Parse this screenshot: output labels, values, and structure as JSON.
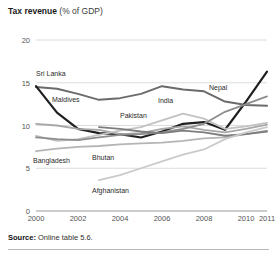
{
  "title": {
    "bold": "Tax revenue",
    "rest": " (% of GDP)"
  },
  "source": {
    "bold": "Source:",
    "rest": " Online table 5.6."
  },
  "chart_data": {
    "type": "line",
    "title": "Tax revenue (% of GDP)",
    "xlabel": "",
    "ylabel": "",
    "xlim": [
      2000,
      2011
    ],
    "ylim": [
      0,
      20
    ],
    "yticks": [
      0,
      5,
      10,
      15,
      20
    ],
    "xticks": [
      2000,
      2002,
      2004,
      2006,
      2008,
      2010,
      2011
    ],
    "grid": true,
    "legend": "inline-labels",
    "x": [
      2000,
      2001,
      2002,
      2003,
      2004,
      2005,
      2006,
      2007,
      2008,
      2009,
      2010,
      2011
    ],
    "series": [
      {
        "name": "Sri Lanka",
        "color": "#6b6b6b",
        "width": 2.0,
        "label_x": 36,
        "label_y": 70,
        "values": [
          14.5,
          14.3,
          13.7,
          13.0,
          13.2,
          13.7,
          14.6,
          14.2,
          14.0,
          12.8,
          12.4,
          12.3
        ]
      },
      {
        "name": "Maldives",
        "color": "#1f1f1f",
        "width": 2.2,
        "label_x": 52,
        "label_y": 96,
        "values": [
          14.6,
          11.5,
          9.6,
          9.1,
          9.0,
          8.6,
          9.3,
          10.2,
          10.4,
          9.5,
          12.8,
          16.3
        ]
      },
      {
        "name": "Pakistan",
        "color": "#a8a8a8",
        "width": 1.8,
        "label_x": 120,
        "label_y": 112,
        "values": [
          10.2,
          10.0,
          9.6,
          9.5,
          9.0,
          9.1,
          9.6,
          9.9,
          9.5,
          9.2,
          9.6,
          10.1
        ]
      },
      {
        "name": "India",
        "color": "#c2c2c2",
        "width": 1.8,
        "label_x": 158,
        "label_y": 97,
        "values": [
          8.8,
          8.2,
          8.4,
          8.9,
          9.4,
          9.8,
          10.6,
          11.4,
          10.8,
          9.6,
          9.9,
          10.3
        ]
      },
      {
        "name": "Nepal",
        "color": "#8d8d8d",
        "width": 1.8,
        "label_x": 209,
        "label_y": 84,
        "values": [
          8.6,
          8.4,
          8.3,
          8.6,
          8.9,
          9.0,
          9.2,
          9.6,
          10.2,
          11.6,
          12.5,
          13.4
        ]
      },
      {
        "name": "Bangladesh",
        "color": "#b5b5b5",
        "width": 1.8,
        "label_x": 33,
        "label_y": 157,
        "values": [
          7.0,
          7.3,
          7.5,
          7.6,
          7.8,
          7.9,
          8.0,
          8.2,
          8.5,
          8.6,
          9.0,
          9.4
        ]
      },
      {
        "name": "Bhutan",
        "color": "#7d7d7d",
        "width": 1.8,
        "label_x": 92,
        "label_y": 154,
        "values": [
          null,
          null,
          null,
          9.8,
          9.6,
          9.3,
          9.1,
          9.4,
          9.2,
          8.8,
          9.0,
          9.3
        ]
      },
      {
        "name": "Afghanistan",
        "color": "#cacaca",
        "width": 1.8,
        "label_x": 92,
        "label_y": 187,
        "values": [
          null,
          null,
          null,
          3.6,
          4.2,
          5.0,
          5.8,
          6.6,
          7.2,
          8.4,
          9.2,
          9.8
        ]
      }
    ]
  }
}
